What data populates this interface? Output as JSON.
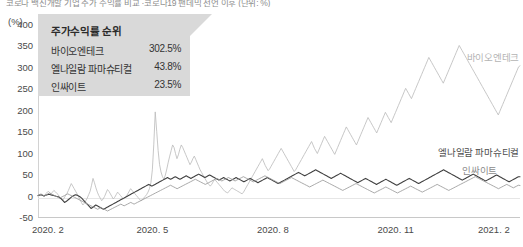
{
  "headline": "코로나 백신개발 기업 주가 수익률 비교 ·코로나19 팬데믹 선언 이후 (단위: %)",
  "axis": {
    "unit_label": "(%)",
    "y_ticks": [
      400,
      350,
      300,
      250,
      200,
      150,
      100,
      50,
      0,
      -50
    ],
    "x_ticks": [
      "2020. 2",
      "2020. 5",
      "2020. 8",
      "2020. 11",
      "2021. 2"
    ]
  },
  "callout": {
    "title": "주가수익률 순위",
    "rows": [
      {
        "name": "바이오엔테크",
        "value": "302.5%"
      },
      {
        "name": "엘나일람 파마슈티컬",
        "value": "43.8%"
      },
      {
        "name": "인싸이트",
        "value": "23.5%"
      }
    ]
  },
  "series_labels": [
    {
      "name": "바이오엔테크",
      "color": "#b4b4b4"
    },
    {
      "name": "엘나일람 파마슈티컬",
      "color": "#4d4d4d"
    },
    {
      "name": "인싸이트",
      "color": "#8c8c8c"
    }
  ],
  "colors": {
    "biontech": "#bdbdbd",
    "alnylam": "#404040",
    "incyte": "#9a9a9a",
    "callout_bg": "#d9d9d9",
    "axis": "#c8c8c8"
  },
  "chart_data": {
    "type": "line",
    "title": "코로나 백신개발 기업 주가 수익률 비교",
    "xlabel": "",
    "ylabel": "(%)",
    "ylim": [
      -50,
      400
    ],
    "xlim": [
      "2020.2",
      "2021.2"
    ],
    "grid": false,
    "legend": "inline-right",
    "x_tick_labels": [
      "2020. 2",
      "2020. 5",
      "2020. 8",
      "2020. 11",
      "2021. 2"
    ],
    "y_tick_values": [
      -50,
      0,
      50,
      100,
      150,
      200,
      250,
      300,
      350,
      400
    ],
    "series": [
      {
        "name": "바이오엔테크",
        "color": "#bdbdbd",
        "final_value": 302.5,
        "values": [
          0,
          2,
          4,
          1,
          -2,
          3,
          6,
          10,
          7,
          4,
          8,
          12,
          9,
          5,
          2,
          -4,
          -8,
          -12,
          -6,
          0,
          5,
          12,
          20,
          28,
          22,
          16,
          10,
          4,
          -2,
          -10,
          -16,
          -22,
          -18,
          -12,
          -6,
          2,
          10,
          24,
          40,
          30,
          18,
          8,
          0,
          -6,
          -12,
          -8,
          -2,
          6,
          14,
          10,
          4,
          -2,
          -8,
          -4,
          2,
          8,
          4,
          0,
          -4,
          -8,
          -6,
          -2,
          4,
          10,
          16,
          12,
          8,
          4,
          0,
          -4,
          -8,
          -12,
          -10,
          -6,
          -2,
          2,
          8,
          16,
          30,
          60,
          120,
          195,
          150,
          105,
          72,
          55,
          44,
          38,
          48,
          62,
          78,
          92,
          105,
          118,
          112,
          98,
          86,
          95,
          108,
          118,
          112,
          104,
          96,
          88,
          80,
          72,
          78,
          86,
          92,
          84,
          76,
          68,
          60,
          54,
          48,
          42,
          36,
          30,
          26,
          22,
          26,
          32,
          38,
          34,
          30,
          26,
          22,
          18,
          14,
          10,
          8,
          6,
          10,
          14,
          18,
          16,
          14,
          12,
          10,
          8,
          6,
          4,
          8,
          14,
          20,
          26,
          32,
          38,
          44,
          50,
          56,
          62,
          68,
          74,
          80,
          86,
          78,
          70,
          64,
          58,
          62,
          68,
          74,
          80,
          86,
          92,
          98,
          104,
          110,
          104,
          98,
          92,
          86,
          80,
          74,
          68,
          62,
          56,
          60,
          66,
          72,
          78,
          84,
          90,
          96,
          102,
          108,
          114,
          120,
          126,
          118,
          110,
          104,
          98,
          106,
          114,
          122,
          130,
          138,
          132,
          126,
          120,
          114,
          108,
          102,
          96,
          104,
          112,
          120,
          128,
          136,
          144,
          152,
          160,
          154,
          148,
          142,
          136,
          130,
          124,
          118,
          126,
          134,
          142,
          150,
          158,
          166,
          174,
          182,
          176,
          170,
          164,
          158,
          152,
          146,
          154,
          162,
          170,
          178,
          186,
          194,
          188,
          182,
          176,
          170,
          178,
          186,
          194,
          202,
          210,
          218,
          226,
          234,
          242,
          250,
          244,
          238,
          232,
          226,
          234,
          242,
          250,
          258,
          266,
          274,
          282,
          290,
          298,
          306,
          314,
          322,
          316,
          310,
          304,
          298,
          292,
          286,
          280,
          274,
          268,
          262,
          270,
          278,
          286,
          294,
          302,
          310,
          318,
          326,
          334,
          342,
          350,
          344,
          338,
          332,
          326,
          320,
          314,
          308,
          302,
          296,
          290,
          284,
          278,
          272,
          266,
          260,
          254,
          248,
          242,
          236,
          230,
          224,
          218,
          212,
          206,
          200,
          194,
          188,
          196,
          204,
          212,
          220,
          228,
          236,
          244,
          252,
          260,
          268,
          276,
          284,
          292,
          300,
          302.5
        ]
      },
      {
        "name": "엘나일람 파마슈티컬",
        "color": "#404040",
        "final_value": 43.8,
        "values": [
          0,
          1,
          2,
          0,
          -1,
          1,
          2,
          3,
          2,
          1,
          0,
          -1,
          -2,
          -3,
          -5,
          -8,
          -12,
          -16,
          -14,
          -11,
          -8,
          -5,
          -2,
          0,
          2,
          1,
          -1,
          -3,
          -6,
          -10,
          -14,
          -18,
          -22,
          -26,
          -30,
          -28,
          -25,
          -22,
          -24,
          -26,
          -28,
          -30,
          -32,
          -30,
          -28,
          -26,
          -24,
          -22,
          -20,
          -18,
          -16,
          -14,
          -12,
          -10,
          -8,
          -6,
          -4,
          -2,
          0,
          2,
          4,
          6,
          8,
          10,
          12,
          14,
          16,
          18,
          20,
          22,
          24,
          26,
          24,
          22,
          24,
          26,
          28,
          30,
          32,
          34,
          36,
          38,
          40,
          42,
          40,
          38,
          40,
          42,
          44,
          42,
          40,
          38,
          40,
          42,
          44,
          46,
          44,
          42,
          40,
          42,
          44,
          46,
          48,
          50,
          48,
          46,
          44,
          42,
          44,
          46,
          48,
          46,
          44,
          42,
          40,
          38,
          36,
          38,
          40,
          42,
          40,
          38,
          36,
          34,
          36,
          38,
          40,
          42,
          40,
          38,
          36,
          34,
          32,
          34,
          36,
          38,
          40,
          38,
          36,
          34,
          32,
          30,
          32,
          34,
          36,
          38,
          40,
          42,
          40,
          38,
          36,
          34,
          32,
          30,
          28,
          30,
          32,
          34,
          36,
          38,
          40,
          42,
          44,
          46,
          48,
          50,
          52,
          54,
          52,
          50,
          48,
          46,
          48,
          50,
          52,
          54,
          56,
          58,
          60,
          58,
          56,
          54,
          52,
          50,
          48,
          46,
          44,
          42,
          40,
          42,
          44,
          46,
          48,
          50,
          52,
          50,
          48,
          46,
          44,
          42,
          40,
          38,
          36,
          34,
          32,
          30,
          32,
          34,
          36,
          38,
          40,
          38,
          36,
          34,
          32,
          30,
          28,
          26,
          28,
          30,
          32,
          34,
          36,
          38,
          36,
          34,
          32,
          30,
          28,
          26,
          24,
          26,
          28,
          30,
          32,
          34,
          36,
          38,
          40,
          38,
          36,
          34,
          32,
          30,
          28,
          30,
          32,
          34,
          36,
          38,
          40,
          42,
          44,
          46,
          48,
          50,
          52,
          54,
          56,
          58,
          60,
          58,
          56,
          54,
          52,
          50,
          48,
          46,
          44,
          42,
          40,
          38,
          36,
          38,
          40,
          42,
          44,
          46,
          48,
          50,
          48,
          46,
          44,
          42,
          40,
          38,
          36,
          34,
          36,
          38,
          40,
          42,
          44,
          46,
          48,
          46,
          44,
          42,
          40,
          38,
          36,
          34,
          32,
          34,
          36,
          38,
          40,
          42,
          44,
          43.8
        ]
      },
      {
        "name": "인싸이트",
        "color": "#9a9a9a",
        "final_value": 23.5,
        "values": [
          0,
          2,
          3,
          1,
          -1,
          2,
          4,
          6,
          4,
          2,
          0,
          -2,
          -4,
          -6,
          -4,
          -2,
          0,
          2,
          4,
          2,
          0,
          -2,
          -4,
          -6,
          -8,
          -10,
          -12,
          -14,
          -16,
          -18,
          -20,
          -22,
          -24,
          -26,
          -28,
          -30,
          -32,
          -30,
          -28,
          -30,
          -32,
          -34,
          -36,
          -34,
          -32,
          -30,
          -28,
          -26,
          -24,
          -22,
          -20,
          -22,
          -24,
          -22,
          -20,
          -18,
          -16,
          -18,
          -20,
          -18,
          -16,
          -14,
          -12,
          -10,
          -8,
          -6,
          -4,
          -2,
          0,
          2,
          4,
          6,
          8,
          10,
          12,
          14,
          16,
          18,
          20,
          22,
          24,
          22,
          20,
          18,
          16,
          18,
          20,
          22,
          24,
          26,
          28,
          30,
          32,
          34,
          36,
          38,
          36,
          34,
          32,
          30,
          28,
          26,
          28,
          30,
          32,
          34,
          36,
          38,
          40,
          38,
          36,
          34,
          36,
          38,
          40,
          42,
          40,
          38,
          36,
          34,
          36,
          38,
          40,
          42,
          44,
          42,
          40,
          38,
          36,
          34,
          32,
          34,
          36,
          38,
          40,
          42,
          44,
          46,
          44,
          42,
          40,
          38,
          36,
          34,
          32,
          30,
          28,
          30,
          32,
          34,
          36,
          38,
          40,
          42,
          40,
          38,
          36,
          34,
          32,
          30,
          28,
          26,
          24,
          22,
          20,
          22,
          24,
          26,
          28,
          30,
          32,
          34,
          36,
          34,
          32,
          30,
          28,
          26,
          24,
          22,
          20,
          18,
          16,
          14,
          12,
          14,
          16,
          18,
          20,
          22,
          24,
          26,
          28,
          26,
          24,
          22,
          20,
          18,
          16,
          14,
          12,
          10,
          8,
          6,
          8,
          10,
          12,
          14,
          16,
          18,
          20,
          18,
          16,
          14,
          12,
          10,
          8,
          6,
          8,
          10,
          12,
          14,
          16,
          18,
          20,
          22,
          20,
          18,
          16,
          14,
          12,
          10,
          8,
          10,
          12,
          14,
          16,
          18,
          20,
          22,
          24,
          26,
          24,
          22,
          20,
          18,
          16,
          14,
          12,
          14,
          16,
          18,
          20,
          22,
          24,
          26,
          28,
          30,
          32,
          34,
          36,
          38,
          40,
          42,
          44,
          42,
          40,
          38,
          36,
          34,
          32,
          30,
          28,
          26,
          24,
          22,
          20,
          18,
          16,
          18,
          20,
          22,
          24,
          26,
          24,
          22,
          20,
          18,
          20,
          22,
          24,
          23.5
        ]
      }
    ]
  }
}
